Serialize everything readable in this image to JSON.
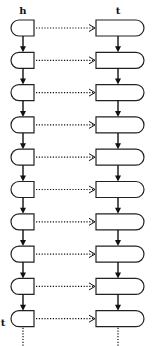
{
  "diagram": {
    "type": "paired-linked-list",
    "labels": {
      "left_column_top": "h",
      "right_column_top": "t",
      "left_column_bottom": "t"
    },
    "row_count": 10,
    "left_column": {
      "node_shape": "rounded-left",
      "link": "solid-arrow-down",
      "continues": true
    },
    "right_column": {
      "node_shape": "rounded-right",
      "link": "solid-arrow-down",
      "continues": true
    },
    "cross_links": {
      "style": "dotted-arrow",
      "direction": "left-to-right",
      "count": 10
    },
    "colors": {
      "stroke": "#111111",
      "background": "#ffffff"
    }
  }
}
